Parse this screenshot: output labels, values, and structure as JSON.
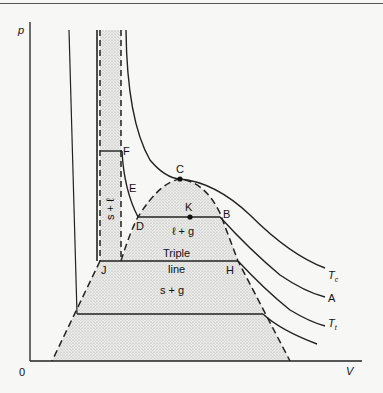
{
  "diagram": {
    "type": "p-V phase diagram",
    "axes": {
      "y_label": "p",
      "x_label": "V",
      "origin_label": "0"
    },
    "points": {
      "C": "C",
      "F": "F",
      "E": "E",
      "D": "D",
      "K": "K",
      "B": "B",
      "J": "J",
      "H": "H"
    },
    "regions": {
      "liquid_gas": "ℓ + g",
      "solid_gas": "s + g",
      "solid_liquid": "s + ℓ",
      "triple_line_top": "Triple",
      "triple_line_bottom": "line"
    },
    "isotherms": {
      "critical": "T",
      "critical_sub": "c",
      "a": "A",
      "triple": "T",
      "triple_sub": "t"
    }
  }
}
